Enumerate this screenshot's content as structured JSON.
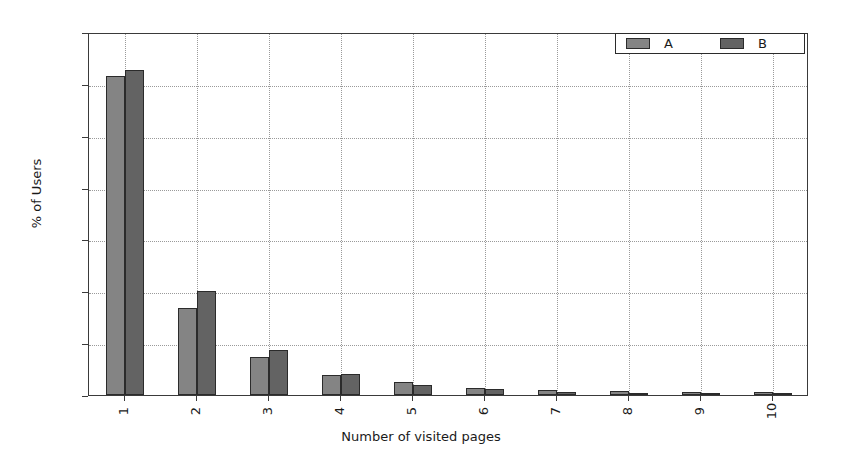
{
  "chart_data": {
    "type": "bar",
    "title": "",
    "xlabel": "Number of visited pages",
    "ylabel": "% of Users",
    "categories": [
      "1",
      "2",
      "3",
      "4",
      "5",
      "6",
      "7",
      "8",
      "9",
      "10"
    ],
    "series": [
      {
        "name": "A",
        "color": "#848484",
        "values": [
          61.5,
          16.7,
          7.4,
          3.9,
          2.5,
          1.4,
          1.0,
          0.7,
          0.6,
          0.5
        ]
      },
      {
        "name": "B",
        "color": "#636363",
        "values": [
          62.7,
          20.0,
          8.6,
          4.1,
          2.0,
          1.1,
          0.5,
          0.3,
          0.3,
          0.3
        ]
      }
    ],
    "ylim": [
      0,
      70
    ],
    "yticks": [
      0,
      10,
      20,
      30,
      40,
      50,
      60,
      70
    ],
    "ytick_labels": [
      "0",
      "10",
      "20",
      "30",
      "40",
      "50",
      "60",
      "70"
    ],
    "grid": true,
    "grid_style": "dotted",
    "legend_position": "upper right",
    "legend_entries": [
      "A",
      "B"
    ],
    "xtick_label_rotation": -90
  }
}
